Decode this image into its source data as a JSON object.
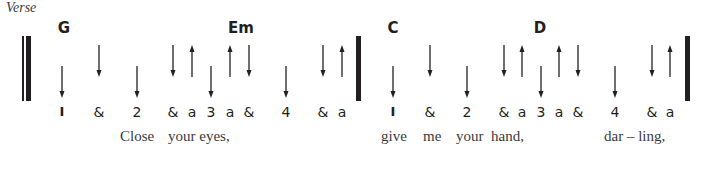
{
  "section_label": "Verse",
  "colors": {
    "ink": "#231f20",
    "lyric": "#3a3a3a"
  },
  "measures": [
    {
      "chords": [
        {
          "name": "G",
          "x": 64
        },
        {
          "name": "Em",
          "x": 241
        }
      ],
      "beats": [
        {
          "label": "1",
          "x": 62,
          "stroke": "down",
          "pos": "low"
        },
        {
          "label": "&",
          "x": 99,
          "stroke": "down",
          "pos": "high"
        },
        {
          "label": "2",
          "x": 137,
          "stroke": "down",
          "pos": "low"
        },
        {
          "label": "&",
          "x": 173,
          "stroke": "down",
          "pos": "high"
        },
        {
          "label": "a",
          "x": 192,
          "stroke": "up",
          "pos": "high"
        },
        {
          "label": "3",
          "x": 211,
          "stroke": "down",
          "pos": "low"
        },
        {
          "label": "a",
          "x": 230,
          "stroke": "up",
          "pos": "high"
        },
        {
          "label": "&",
          "x": 249,
          "stroke": "down",
          "pos": "high"
        },
        {
          "label": "4",
          "x": 286,
          "stroke": "down",
          "pos": "low"
        },
        {
          "label": "&",
          "x": 323,
          "stroke": "down",
          "pos": "high"
        },
        {
          "label": "a",
          "x": 342,
          "stroke": "up",
          "pos": "high"
        }
      ],
      "lyrics": [
        {
          "text": "Close",
          "x": 120
        },
        {
          "text": "your eyes,",
          "x": 168
        }
      ]
    },
    {
      "chords": [
        {
          "name": "C",
          "x": 393
        },
        {
          "name": "D",
          "x": 540
        }
      ],
      "beats": [
        {
          "label": "1",
          "x": 393,
          "stroke": "down",
          "pos": "low"
        },
        {
          "label": "&",
          "x": 430,
          "stroke": "down",
          "pos": "high"
        },
        {
          "label": "2",
          "x": 467,
          "stroke": "down",
          "pos": "low"
        },
        {
          "label": "&",
          "x": 504,
          "stroke": "down",
          "pos": "high"
        },
        {
          "label": "a",
          "x": 522,
          "stroke": "up",
          "pos": "high"
        },
        {
          "label": "3",
          "x": 541,
          "stroke": "down",
          "pos": "low"
        },
        {
          "label": "a",
          "x": 559,
          "stroke": "up",
          "pos": "high"
        },
        {
          "label": "&",
          "x": 578,
          "stroke": "down",
          "pos": "high"
        },
        {
          "label": "4",
          "x": 615,
          "stroke": "down",
          "pos": "low"
        },
        {
          "label": "&",
          "x": 652,
          "stroke": "down",
          "pos": "high"
        },
        {
          "label": "a",
          "x": 670,
          "stroke": "up",
          "pos": "high"
        }
      ],
      "lyrics": [
        {
          "text": "give",
          "x": 381
        },
        {
          "text": "me",
          "x": 423
        },
        {
          "text": "your",
          "x": 456
        },
        {
          "text": "hand,",
          "x": 491
        },
        {
          "text": "dar – ling,",
          "x": 604
        }
      ]
    }
  ],
  "barlines": [
    {
      "type": "thin",
      "x": 22,
      "w": 2
    },
    {
      "type": "thick",
      "x": 26,
      "w": 5
    },
    {
      "type": "thick",
      "x": 356,
      "w": 5
    },
    {
      "type": "thick",
      "x": 685,
      "w": 5
    }
  ]
}
